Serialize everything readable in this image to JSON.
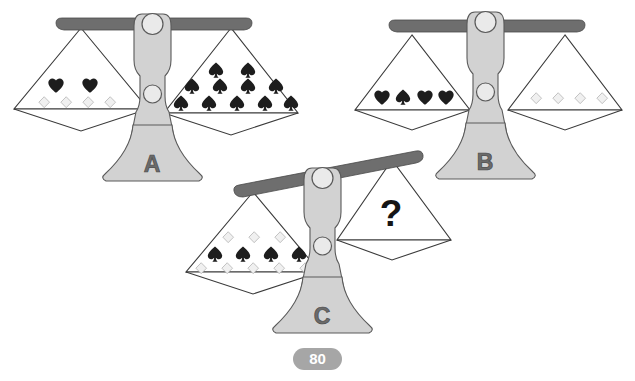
{
  "page": {
    "background_color": "#ffffff"
  },
  "colors": {
    "symbol_filled": "#1d1d1d",
    "symbol_outline_fill": "#f0f0f0",
    "symbol_outline_stroke": "#a8a8a8",
    "beam": "#6e6e6e",
    "post": "#d2d2d2",
    "joint": "#eaeaea",
    "outline": "#3a3a3a",
    "letter": "#6b6b6b",
    "badge": "#a6a6a6"
  },
  "scales": [
    {
      "id": "scale-a",
      "letter": "A",
      "state": "balanced",
      "tilt_degrees": 0,
      "left_pan": {
        "name": "pan-a-left",
        "rows": [
          {
            "symbol": "heart",
            "count": 2
          },
          {
            "symbol": "diamond",
            "count": 4
          }
        ],
        "totals": {
          "heart": 2,
          "diamond": 4,
          "spade": 0
        }
      },
      "right_pan": {
        "name": "pan-a-right",
        "rows": [
          {
            "symbol": "spade",
            "count": 2
          },
          {
            "symbol": "spade",
            "count": 4
          },
          {
            "symbol": "spade",
            "count": 5
          }
        ],
        "totals": {
          "heart": 0,
          "diamond": 0,
          "spade": 11
        }
      }
    },
    {
      "id": "scale-b",
      "letter": "B",
      "state": "balanced",
      "tilt_degrees": 0,
      "left_pan": {
        "name": "pan-b-left",
        "rows": [
          {
            "symbol": "mixed",
            "sequence": [
              "heart",
              "spade",
              "heart",
              "heart"
            ],
            "count": 4
          }
        ],
        "totals": {
          "heart": 3,
          "diamond": 0,
          "spade": 1
        }
      },
      "right_pan": {
        "name": "pan-b-right",
        "rows": [
          {
            "symbol": "diamond",
            "count": 4
          }
        ],
        "totals": {
          "heart": 0,
          "diamond": 4,
          "spade": 0
        }
      }
    },
    {
      "id": "scale-c",
      "letter": "C",
      "state": "tilted-left",
      "tilt_degrees": -13,
      "left_pan": {
        "name": "pan-c-left",
        "rows": [
          {
            "symbol": "diamond",
            "count": 3
          },
          {
            "symbol": "spade",
            "count": 4
          },
          {
            "symbol": "diamond",
            "count": 5
          }
        ],
        "totals": {
          "heart": 0,
          "diamond": 8,
          "spade": 4
        }
      },
      "right_pan": {
        "name": "pan-c-right",
        "rows": [],
        "unknown_label": "?",
        "totals": {
          "heart": 0,
          "diamond": 0,
          "spade": 0
        }
      }
    }
  ],
  "page_badge": {
    "name": "page-number-badge",
    "value": "80"
  }
}
